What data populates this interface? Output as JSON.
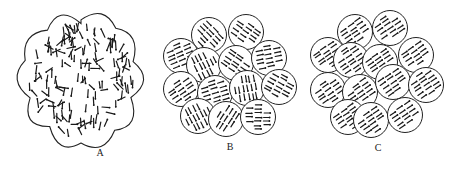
{
  "figure": {
    "panels": [
      {
        "id": "A",
        "label": "A",
        "description": "single blob with randomly oriented domains"
      },
      {
        "id": "B",
        "label": "B",
        "description": "grains each with internally aligned domains, grains randomly oriented"
      },
      {
        "id": "C",
        "label": "C",
        "description": "grains all aligned in same direction"
      }
    ],
    "colors": {
      "line": "#222222",
      "background": "#ffffff"
    }
  }
}
